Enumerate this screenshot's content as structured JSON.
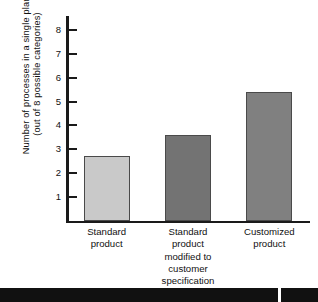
{
  "chart_data": {
    "type": "bar",
    "title": "",
    "xlabel": "",
    "ylabel": "Number of processes in a single plant (out of 8 possible categories)",
    "ylabel_lines": [
      "Number of processes in a single plant",
      "(out of 8 possible categories)"
    ],
    "categories": [
      "Standard product",
      "Standard product modified to customer specification",
      "Customized product"
    ],
    "category_lines": [
      [
        "Standard",
        "product"
      ],
      [
        "Standard",
        "product",
        "modified to",
        "customer",
        "specification"
      ],
      [
        "Customized",
        "product"
      ]
    ],
    "values": [
      2.7,
      3.6,
      5.4
    ],
    "ylim": [
      0,
      8.6
    ],
    "yticks": [
      1,
      2,
      3,
      4,
      5,
      6,
      7,
      8
    ],
    "ytick_labels": [
      "1",
      "2",
      "3",
      "4",
      "5",
      "6",
      "7",
      "8"
    ],
    "grid": false,
    "legend": null,
    "bar_colors": [
      "#c9c9c9",
      "#737373",
      "#808080"
    ],
    "bar_edge_color": "#4a4a4a",
    "axis_color": "#1a1a1a",
    "background": "#ffffff"
  },
  "figure": {
    "bottom_band_color": "#111111"
  }
}
